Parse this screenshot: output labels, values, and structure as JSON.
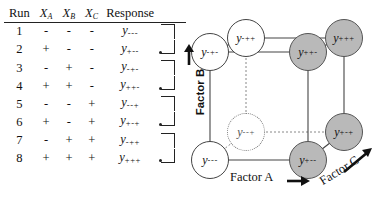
{
  "table": {
    "headers": {
      "run": "Run",
      "xa": "X",
      "xa_sub": "A",
      "xb": "X",
      "xb_sub": "B",
      "xc": "X",
      "xc_sub": "C",
      "response": "Response"
    },
    "rows": [
      {
        "run": "1",
        "xa": "-",
        "xb": "-",
        "xc": "-",
        "response": "y",
        "response_sub": "---",
        "bracket": "top"
      },
      {
        "run": "2",
        "xa": "+",
        "xb": "-",
        "xc": "-",
        "response": "y",
        "response_sub": "+--",
        "bracket": "bottom"
      },
      {
        "run": "3",
        "xa": "-",
        "xb": "+",
        "xc": "-",
        "response": "y",
        "response_sub": "-+-",
        "bracket": "top"
      },
      {
        "run": "4",
        "xa": "+",
        "xb": "+",
        "xc": "-",
        "response": "y",
        "response_sub": "++-",
        "bracket": "bottom"
      },
      {
        "run": "5",
        "xa": "-",
        "xb": "-",
        "xc": "+",
        "response": "y",
        "response_sub": "--+",
        "bracket": "top"
      },
      {
        "run": "6",
        "xa": "+",
        "xb": "-",
        "xc": "+",
        "response": "y",
        "response_sub": "+-+",
        "bracket": "bottom"
      },
      {
        "run": "7",
        "xa": "-",
        "xb": "+",
        "xc": "+",
        "response": "y",
        "response_sub": "-++",
        "bracket": "top"
      },
      {
        "run": "8",
        "xa": "+",
        "xb": "+",
        "xc": "+",
        "response": "y",
        "response_sub": "+++",
        "bracket": "bottom"
      }
    ]
  },
  "cube": {
    "axes": [
      {
        "id": "factor-a",
        "label": "Factor A",
        "arrow": "➡",
        "direction": "right"
      },
      {
        "id": "factor-b",
        "label": "Factor B",
        "arrow": "⬆",
        "direction": "up"
      },
      {
        "id": "factor-c",
        "label": "Factor C",
        "arrow": "↗",
        "direction": "up-right-diagonal"
      }
    ],
    "nodes": [
      {
        "id": "node-mmm",
        "label": "y",
        "sub": "---",
        "style": "white",
        "position": "front-bottom-left"
      },
      {
        "id": "node-pmm",
        "label": "y",
        "sub": "+--",
        "style": "gray",
        "position": "front-bottom-right"
      },
      {
        "id": "node-mpm",
        "label": "y",
        "sub": "-+-",
        "style": "white",
        "position": "front-top-left"
      },
      {
        "id": "node-ppm",
        "label": "y",
        "sub": "++-",
        "style": "gray",
        "position": "front-top-right"
      },
      {
        "id": "node-mmp",
        "label": "y",
        "sub": "--+",
        "style": "dashed",
        "position": "back-bottom-left"
      },
      {
        "id": "node-pmp",
        "label": "y",
        "sub": "+-+",
        "style": "gray",
        "position": "back-bottom-right"
      },
      {
        "id": "node-mpp",
        "label": "y",
        "sub": "-++",
        "style": "white",
        "position": "back-top-left"
      },
      {
        "id": "node-ppp",
        "label": "y",
        "sub": "+++",
        "style": "gray",
        "position": "back-top-right"
      }
    ],
    "colors": {
      "node_fill_high_a": "#b9b9b9",
      "node_fill_low_a": "#ffffff",
      "edge": "#444444",
      "hidden_edge": "#888888"
    }
  }
}
